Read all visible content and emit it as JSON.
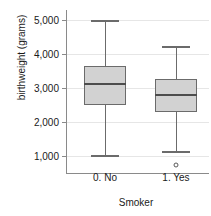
{
  "chart_data": {
    "type": "box",
    "title": "",
    "xlabel": "Smoker",
    "ylabel": "birthweight (grams)",
    "categories": [
      "0. No",
      "1. Yes"
    ],
    "ylim": [
      500,
      5300
    ],
    "yticks": [
      1000,
      2000,
      3000,
      4000,
      5000
    ],
    "ytick_labels": [
      "1,000",
      "2,000",
      "3,000",
      "4,000",
      "5,000"
    ],
    "grid": true,
    "legend": "none",
    "boxes": [
      {
        "category": "0. No",
        "whisker_low": 1020,
        "q1": 2500,
        "median": 3110,
        "q3": 3650,
        "whisker_high": 5000,
        "outliers": []
      },
      {
        "category": "1. Yes",
        "whisker_low": 1150,
        "q1": 2290,
        "median": 2790,
        "q3": 3280,
        "whisker_high": 4250,
        "outliers": [
          750
        ]
      }
    ],
    "colors": {
      "box_fill": "#d2d2d2",
      "box_border": "#6b6b6b",
      "median": "#4d4d4d",
      "gridline": "#e6e6e6",
      "axis": "#8a8a8a",
      "text": "#1a1a1a",
      "background": "#ffffff"
    }
  }
}
